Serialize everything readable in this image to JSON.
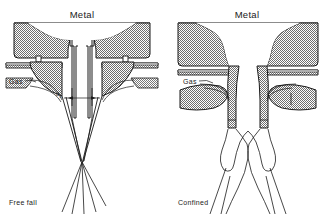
{
  "figure": {
    "type": "technical-cross-section-diagram",
    "panels": [
      {
        "id": "free-fall",
        "position": "left",
        "top_label": "Metal",
        "gas_label": "Gas",
        "caption": "Free fall",
        "dimension_label": "d",
        "dimension_subscript": "0",
        "description": "Free fall atomizer: metal delivery tube extends well below the gas die; gas jets converge onto the free-falling metal stream at a point below the nozzle."
      },
      {
        "id": "confined",
        "position": "right",
        "top_label": "Metal",
        "gas_label": "Gas",
        "caption": "Confined",
        "description": "Close-coupled (confined) atomizer: metal exits at the gas die face where gas impinges immediately, producing a confined recirculating spray cone."
      }
    ],
    "colors": {
      "line": "#1a1a1a",
      "hatch_fill": "#8c8c8c",
      "background": "#ffffff",
      "text": "#1a1a1a"
    }
  }
}
